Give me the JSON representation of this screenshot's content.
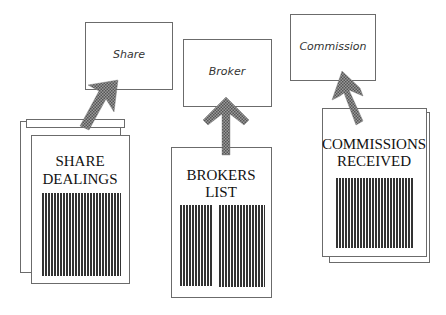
{
  "diagram": {
    "type": "document-to-entity mapping",
    "colors": {
      "line": "#6b6b6b",
      "arrow": "#6e6e6e",
      "barcode": "#333333",
      "background": "#ffffff"
    },
    "entities": [
      {
        "id": "share",
        "label": "Share"
      },
      {
        "id": "broker",
        "label": "Broker"
      },
      {
        "id": "commission",
        "label": "Commission"
      }
    ],
    "documents": [
      {
        "id": "share-dealings",
        "title_lines": [
          "SHARE",
          "DEALINGS"
        ],
        "maps_to": "share",
        "stacked": true
      },
      {
        "id": "brokers-list",
        "title_lines": [
          "BROKERS",
          "LIST"
        ],
        "maps_to": "broker",
        "stacked": false
      },
      {
        "id": "commissions-received",
        "title_lines": [
          "COMMISSIONS",
          "RECEIVED"
        ],
        "maps_to": "commission",
        "stacked": true
      }
    ]
  }
}
